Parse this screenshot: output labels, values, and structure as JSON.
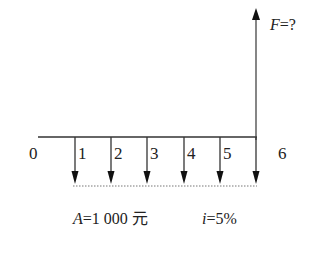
{
  "diagram": {
    "type": "cash-flow-diagram",
    "future_value_label": "F=?",
    "future_value_symbol": "F",
    "future_value_rest": "=?",
    "axis": {
      "periods": [
        "0",
        "1",
        "2",
        "3",
        "4",
        "5",
        "6"
      ]
    },
    "annuity": {
      "symbol": "A",
      "rest": "=1 000 元",
      "full": "A=1 000 元"
    },
    "rate": {
      "symbol": "i",
      "rest": "=5%",
      "full": "i=5%"
    },
    "colors": {
      "line": "#222222",
      "dotted": "#777777",
      "background": "#ffffff"
    }
  }
}
